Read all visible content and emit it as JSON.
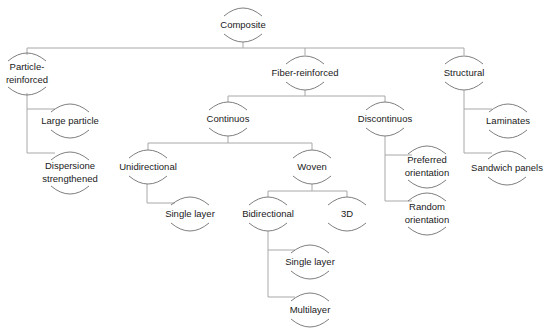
{
  "diagram": {
    "title": "Composite",
    "type": "tree",
    "colors": {
      "edge": "#a8a8a8",
      "arc": "#6f6f6f",
      "text": "#1a1a1a",
      "background": "#ffffff"
    },
    "nodes": [
      {
        "id": "composite",
        "lines": [
          "Composite"
        ],
        "x": 243,
        "y": 25
      },
      {
        "id": "particle-reinforced",
        "lines": [
          "Particle-",
          "reinforced"
        ],
        "x": 27,
        "y": 74
      },
      {
        "id": "fiber-reinforced",
        "lines": [
          "Fiber-reinforced"
        ],
        "x": 305,
        "y": 73
      },
      {
        "id": "structural",
        "lines": [
          "Structural"
        ],
        "x": 464,
        "y": 73
      },
      {
        "id": "large-particle",
        "lines": [
          "Large particle"
        ],
        "x": 70,
        "y": 121
      },
      {
        "id": "dispersione-strengthened",
        "lines": [
          "Dispersione",
          "strengthened"
        ],
        "x": 70,
        "y": 173
      },
      {
        "id": "continuos",
        "lines": [
          "Continuos"
        ],
        "x": 228,
        "y": 119
      },
      {
        "id": "discontinuos",
        "lines": [
          "Discontinuos"
        ],
        "x": 385,
        "y": 119
      },
      {
        "id": "laminates",
        "lines": [
          "Laminates"
        ],
        "x": 508,
        "y": 121
      },
      {
        "id": "sandwich-panels",
        "lines": [
          "Sandwich panels"
        ],
        "x": 507,
        "y": 168
      },
      {
        "id": "unidirectional",
        "lines": [
          "Unidirectional"
        ],
        "x": 148,
        "y": 167
      },
      {
        "id": "woven",
        "lines": [
          "Woven"
        ],
        "x": 312,
        "y": 167
      },
      {
        "id": "preferred-orientation",
        "lines": [
          "Preferred",
          "orientation"
        ],
        "x": 427,
        "y": 167
      },
      {
        "id": "random-orientation",
        "lines": [
          "Random",
          "orientation"
        ],
        "x": 427,
        "y": 214
      },
      {
        "id": "single-layer-uni",
        "lines": [
          "Single layer"
        ],
        "x": 190,
        "y": 214
      },
      {
        "id": "bidirectional",
        "lines": [
          "Bidirectional"
        ],
        "x": 268,
        "y": 214
      },
      {
        "id": "3d",
        "lines": [
          "3D"
        ],
        "x": 347,
        "y": 214
      },
      {
        "id": "single-layer-bi",
        "lines": [
          "Single layer"
        ],
        "x": 310,
        "y": 262
      },
      {
        "id": "multilayer",
        "lines": [
          "Multilayer"
        ],
        "x": 310,
        "y": 310
      }
    ],
    "edges": [
      {
        "points": [
          [
            243,
            42
          ],
          [
            243,
            48
          ]
        ]
      },
      {
        "points": [
          [
            27,
            48
          ],
          [
            464,
            48
          ]
        ]
      },
      {
        "points": [
          [
            27,
            48
          ],
          [
            27,
            55
          ]
        ]
      },
      {
        "points": [
          [
            305,
            48
          ],
          [
            305,
            55
          ]
        ]
      },
      {
        "points": [
          [
            464,
            48
          ],
          [
            464,
            55
          ]
        ]
      },
      {
        "points": [
          [
            27,
            93
          ],
          [
            27,
            153
          ],
          [
            55,
            153
          ]
        ]
      },
      {
        "points": [
          [
            27,
            109
          ],
          [
            55,
            109
          ]
        ]
      },
      {
        "points": [
          [
            305,
            90
          ],
          [
            305,
            96
          ]
        ]
      },
      {
        "points": [
          [
            228,
            96
          ],
          [
            385,
            96
          ]
        ]
      },
      {
        "points": [
          [
            228,
            96
          ],
          [
            228,
            102
          ]
        ]
      },
      {
        "points": [
          [
            385,
            96
          ],
          [
            385,
            102
          ]
        ]
      },
      {
        "points": [
          [
            464,
            90
          ],
          [
            464,
            153
          ],
          [
            492,
            153
          ]
        ]
      },
      {
        "points": [
          [
            464,
            109
          ],
          [
            492,
            109
          ]
        ]
      },
      {
        "points": [
          [
            228,
            136
          ],
          [
            228,
            143
          ]
        ]
      },
      {
        "points": [
          [
            148,
            143
          ],
          [
            312,
            143
          ]
        ]
      },
      {
        "points": [
          [
            148,
            143
          ],
          [
            148,
            150
          ]
        ]
      },
      {
        "points": [
          [
            312,
            143
          ],
          [
            312,
            150
          ]
        ]
      },
      {
        "points": [
          [
            385,
            136
          ],
          [
            385,
            201
          ],
          [
            412,
            201
          ]
        ]
      },
      {
        "points": [
          [
            385,
            155
          ],
          [
            412,
            155
          ]
        ]
      },
      {
        "points": [
          [
            147,
            184
          ],
          [
            147,
            203
          ],
          [
            175,
            203
          ]
        ]
      },
      {
        "points": [
          [
            312,
            184
          ],
          [
            312,
            191
          ]
        ]
      },
      {
        "points": [
          [
            268,
            191
          ],
          [
            347,
            191
          ]
        ]
      },
      {
        "points": [
          [
            268,
            191
          ],
          [
            268,
            197
          ]
        ]
      },
      {
        "points": [
          [
            347,
            191
          ],
          [
            347,
            197
          ]
        ]
      },
      {
        "points": [
          [
            268,
            231
          ],
          [
            268,
            297
          ],
          [
            295,
            297
          ]
        ]
      },
      {
        "points": [
          [
            268,
            250
          ],
          [
            295,
            250
          ]
        ]
      }
    ]
  }
}
